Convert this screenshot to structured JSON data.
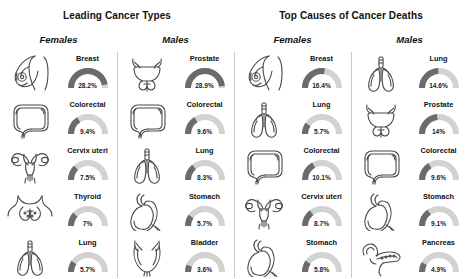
{
  "sections": [
    {
      "title": "Leading Cancer Types"
    },
    {
      "title": "Top Causes of Cancer Deaths"
    }
  ],
  "columns": [
    {
      "sex": "Females"
    },
    {
      "sex": "Males"
    },
    {
      "sex": "Females"
    },
    {
      "sex": "Males"
    }
  ],
  "colors": {
    "gauge_fill": "#6b6b6b",
    "gauge_track": "#d2d2d2",
    "icon_stroke": "#4a4a4a",
    "divider": "#c9c9c9",
    "text": "#111111"
  },
  "chart_data": {
    "type": "bar",
    "xlabel": "",
    "ylabel": "Share of cases or deaths (%)",
    "ylim": [
      0,
      30
    ],
    "note": "Each item rendered as a semicircular gauge; gauge arc sweep is proportional to the percentage value against a 30% full-scale track.",
    "gauge_scale_max": 30,
    "series": [
      {
        "name": "Leading Cancer Types — Females",
        "section": "Leading Cancer Types",
        "sex": "Females",
        "categories": [
          "Breast",
          "Colorectal",
          "Cervix uteri",
          "Thyroid",
          "Lung"
        ],
        "values": [
          28.2,
          9.4,
          7.5,
          7,
          5.7
        ],
        "labels": [
          "28.2%",
          "9.4%",
          "7.5%",
          "7%",
          "5.7%"
        ],
        "icons": [
          "breast-icon",
          "colon-icon",
          "uterus-icon",
          "thyroid-icon",
          "lungs-icon"
        ]
      },
      {
        "name": "Leading Cancer Types — Males",
        "section": "Leading Cancer Types",
        "sex": "Males",
        "categories": [
          "Prostate",
          "Colorectal",
          "Lung",
          "Stomach",
          "Bladder"
        ],
        "values": [
          28.9,
          9.6,
          8.3,
          5.7,
          3.6
        ],
        "labels": [
          "28.9%",
          "9.6%",
          "8.3%",
          "5.7%",
          "3.6%"
        ],
        "icons": [
          "prostate-icon",
          "colon-icon",
          "lungs-icon",
          "stomach-icon",
          "bladder-icon"
        ]
      },
      {
        "name": "Top Causes of Cancer Deaths — Females",
        "section": "Top Causes of Cancer Deaths",
        "sex": "Females",
        "categories": [
          "Breast",
          "Lung",
          "Colorectal",
          "Cervix uteri",
          "Stomach"
        ],
        "values": [
          16.4,
          5.7,
          10.1,
          8.7,
          5.8
        ],
        "labels": [
          "16.4%",
          "5.7%",
          "10.1%",
          "8.7%",
          "5.8%"
        ],
        "icons": [
          "breast-icon",
          "lungs-icon",
          "colon-icon",
          "uterus-icon",
          "stomach-icon"
        ]
      },
      {
        "name": "Top Causes of Cancer Deaths — Males",
        "section": "Top Causes of Cancer Deaths",
        "sex": "Males",
        "categories": [
          "Lung",
          "Prostate",
          "Colorectal",
          "Stomach",
          "Pancreas"
        ],
        "values": [
          14.6,
          14,
          9.6,
          9.1,
          4.9
        ],
        "labels": [
          "14.6%",
          "14%",
          "9.6%",
          "9.1%",
          "4.9%"
        ],
        "icons": [
          "lungs-icon",
          "prostate-icon",
          "colon-icon",
          "stomach-icon",
          "pancreas-icon"
        ]
      }
    ]
  }
}
